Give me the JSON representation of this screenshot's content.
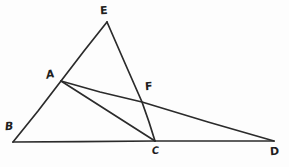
{
  "figure": {
    "background_color": "#fdfdfd",
    "stroke_color": "#2b2b2b",
    "width": 289,
    "height": 167,
    "points": [
      {
        "id": "E",
        "label": "E",
        "x": 107,
        "y": 22,
        "label_x": 100,
        "label_y": 5,
        "role": "apex-vertex"
      },
      {
        "id": "A",
        "label": "A",
        "x": 61,
        "y": 81,
        "label_x": 46,
        "label_y": 69,
        "role": "point-on-segment-BE"
      },
      {
        "id": "F",
        "label": "F",
        "x": 142,
        "y": 102,
        "label_x": 145,
        "label_y": 81,
        "role": "intersection-point"
      },
      {
        "id": "B",
        "label": "B",
        "x": 13,
        "y": 142,
        "label_x": 5,
        "label_y": 121,
        "role": "base-left-vertex"
      },
      {
        "id": "C",
        "label": "C",
        "x": 155,
        "y": 141,
        "label_x": 152,
        "label_y": 146,
        "role": "base-mid-vertex"
      },
      {
        "id": "D",
        "label": "D",
        "x": 274,
        "y": 141,
        "label_x": 270,
        "label_y": 146,
        "role": "base-right-vertex"
      }
    ],
    "segments": [
      {
        "id": "BE",
        "from": "B",
        "to": "E",
        "path": "M 13 142 L 61 81 L 107 22",
        "note": "left side of triangle through A"
      },
      {
        "id": "EC",
        "from": "E",
        "to": "C",
        "path": "M 107 22 L 142 102 L 155 141",
        "note": "right side of triangle through F"
      },
      {
        "id": "BD",
        "from": "B",
        "to": "D",
        "path": "M 13 142 L 155 141 L 274 141",
        "note": "baseline through C"
      },
      {
        "id": "AC",
        "from": "A",
        "to": "C",
        "path": "M 61 81 L 155 141",
        "note": "cevian from A to C"
      },
      {
        "id": "AD",
        "from": "A",
        "to": "D",
        "path": "M 61 81 L 142 102 L 274 141",
        "note": "line from A to D through F"
      }
    ]
  }
}
